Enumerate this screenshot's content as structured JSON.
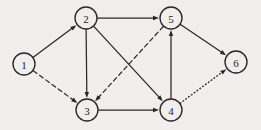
{
  "figure": {
    "kind": "directed-graph-diagram",
    "background_color": "#f1efed",
    "ink_color": "#2b2724",
    "width": 261,
    "height": 130
  },
  "graph": {
    "node_radius": 11,
    "nodes": [
      {
        "id": "1",
        "label": "1",
        "x": 24,
        "y": 64
      },
      {
        "id": "2",
        "label": "2",
        "x": 86,
        "y": 18
      },
      {
        "id": "3",
        "label": "3",
        "x": 87,
        "y": 110
      },
      {
        "id": "4",
        "label": "4",
        "x": 171,
        "y": 110
      },
      {
        "id": "5",
        "label": "5",
        "x": 171,
        "y": 18
      },
      {
        "id": "6",
        "label": "6",
        "x": 236,
        "y": 62
      }
    ],
    "edges": [
      {
        "from": "1",
        "to": "2",
        "style": "solid",
        "directed": true
      },
      {
        "from": "1",
        "to": "3",
        "style": "dashed",
        "directed": true
      },
      {
        "from": "2",
        "to": "5",
        "style": "solid",
        "directed": true
      },
      {
        "from": "2",
        "to": "3",
        "style": "solid",
        "directed": true
      },
      {
        "from": "2",
        "to": "4",
        "style": "solid",
        "directed": true
      },
      {
        "from": "5",
        "to": "3",
        "style": "dashed",
        "directed": true
      },
      {
        "from": "5",
        "to": "6",
        "style": "solid",
        "directed": true
      },
      {
        "from": "3",
        "to": "4",
        "style": "solid",
        "directed": true
      },
      {
        "from": "4",
        "to": "5",
        "style": "solid",
        "directed": true
      },
      {
        "from": "4",
        "to": "6",
        "style": "dotted",
        "directed": true
      }
    ]
  }
}
